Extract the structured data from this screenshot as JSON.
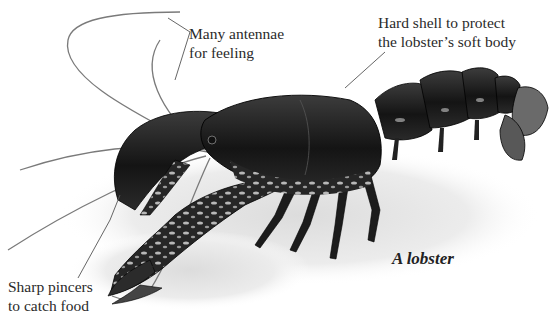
{
  "diagram": {
    "subject": "lobster",
    "caption": "A lobster",
    "colors": {
      "background": "#ffffff",
      "shell_dark": "#1e1e1e",
      "shell_mid": "#3a3a3a",
      "mottle_light": "#bdbdbd",
      "ground": "#e6e6e6",
      "text": "#2a2a2a",
      "leader_line": "#555555"
    },
    "labels": [
      {
        "id": "antennae",
        "lines": [
          "Many antennae",
          "for feeling"
        ]
      },
      {
        "id": "shell",
        "lines": [
          "Hard shell to protect",
          "the lobster’s soft body"
        ]
      },
      {
        "id": "pincers",
        "lines": [
          "Sharp pincers",
          "to catch food"
        ]
      }
    ]
  }
}
